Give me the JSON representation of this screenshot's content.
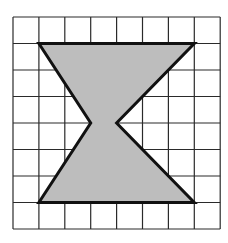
{
  "figure": {
    "type": "grid-shape",
    "grid": {
      "cols": 8,
      "rows": 8,
      "origin_px": [
        13,
        17
      ],
      "cell_w": 25.9,
      "cell_h": 26.5,
      "line_color": "#2a2a2a"
    },
    "shape": {
      "name": "bow-tie hexagon",
      "fill": "#bdbdbd",
      "stroke": "#111111",
      "vertices": [
        [
          1,
          1
        ],
        [
          7,
          1
        ],
        [
          4,
          4
        ],
        [
          7,
          7
        ],
        [
          1,
          7
        ],
        [
          3,
          4
        ]
      ]
    }
  }
}
